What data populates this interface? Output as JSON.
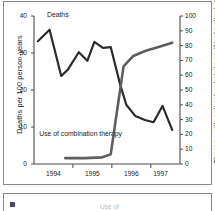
{
  "figure": {
    "panel_a_name": "mortality-and-therapy-chart",
    "panel_b_name": "second-panel-cropped"
  },
  "panel_b": {
    "marker_icon": "square-marker-icon",
    "partial_text": "Use of"
  },
  "chart_data": {
    "type": "line",
    "title": "",
    "xlabel": "",
    "ylabel": "Deaths per 100 person-years",
    "y2label": "Therapy with anti-retroviral drugs (% of patient days)",
    "xlim": [
      1993.75,
      1997.5
    ],
    "ylim": [
      0,
      40
    ],
    "y2lim": [
      0,
      100
    ],
    "grid": false,
    "legend": "inline-annotations",
    "x_tick_labels": [
      "1994",
      "1995",
      "1996",
      "1997"
    ],
    "x_tick_positions": [
      1994.25,
      1995.25,
      1996.25,
      1997.0
    ],
    "x_major_ticks": [
      1994.75,
      1995.75,
      1996.75
    ],
    "y_tick_labels": [
      "0",
      "10",
      "20",
      "30",
      "40"
    ],
    "y_tick_values": [
      0,
      10,
      20,
      30,
      40
    ],
    "y2_tick_labels": [
      "0",
      "10",
      "20",
      "30",
      "40",
      "50",
      "60",
      "70",
      "80",
      "90",
      "100"
    ],
    "y2_tick_values": [
      0,
      10,
      20,
      30,
      40,
      50,
      60,
      70,
      80,
      90,
      100
    ],
    "series": [
      {
        "name": "Deaths",
        "annotation": "Deaths",
        "axis": "left",
        "color": "#2b2b2b",
        "x": [
          1993.85,
          1994.15,
          1994.45,
          1994.62,
          1994.9,
          1995.12,
          1995.3,
          1995.52,
          1995.72,
          1995.95,
          1996.12,
          1996.35,
          1996.6,
          1996.82,
          1997.05,
          1997.3
        ],
        "values": [
          33.2,
          36.3,
          23.8,
          25.5,
          30.2,
          27.9,
          33.0,
          31.4,
          31.6,
          22.0,
          16.0,
          13.0,
          11.9,
          11.3,
          15.7,
          9.2
        ]
      },
      {
        "name": "Use of combination therapy",
        "annotation": "Use of combination therapy",
        "axis": "right",
        "color": "#5e5e5e",
        "x": [
          1994.55,
          1995.05,
          1995.5,
          1995.72,
          1996.05,
          1996.3,
          1996.62,
          1996.95,
          1997.3
        ],
        "values": [
          4.0,
          4.0,
          4.5,
          6.5,
          66.0,
          73.0,
          76.5,
          79.0,
          82.0
        ]
      }
    ],
    "crossing_point": {
      "x": 1995.88,
      "deaths": 20.5,
      "therapy_pct": 51
    }
  }
}
